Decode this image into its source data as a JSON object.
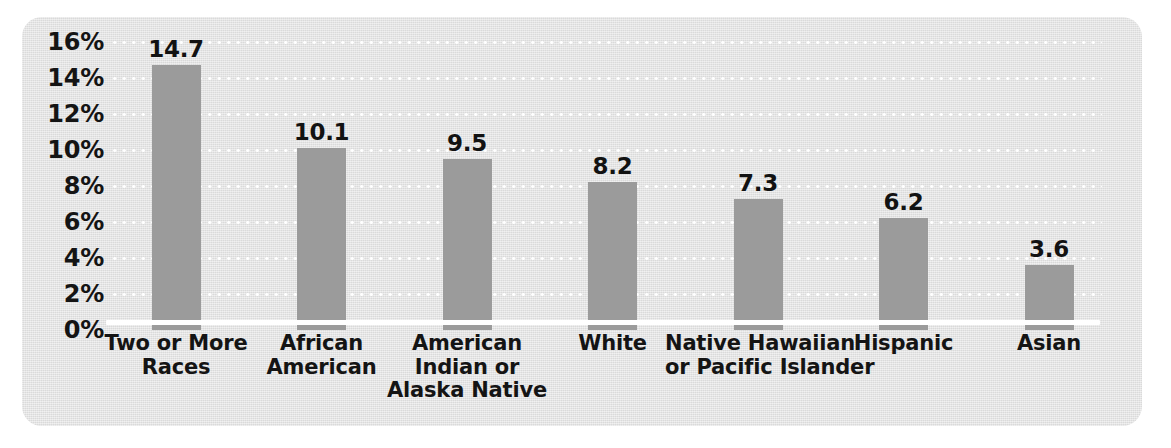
{
  "chart_data": {
    "type": "bar",
    "title": "",
    "subtitle": "",
    "xlabel": "",
    "ylabel": "",
    "categories": [
      "Two or More Races",
      "African American",
      "American Indian or Alaska Native",
      "White",
      "Native Hawaiian or Pacific Islander",
      "Hispanic",
      "Asian"
    ],
    "category_lines": [
      [
        "Two or More",
        "Races"
      ],
      [
        "African",
        "American"
      ],
      [
        "American",
        "Indian or",
        "Alaska Native"
      ],
      [
        "White"
      ],
      [
        "Native Hawaiian",
        "or Pacific Islander"
      ],
      [
        "Hispanic"
      ],
      [
        "Asian"
      ]
    ],
    "values": [
      14.7,
      10.1,
      9.5,
      8.2,
      7.3,
      6.2,
      3.6
    ],
    "value_labels": [
      "14.7",
      "10.1",
      "9.5",
      "8.2",
      "7.3",
      "6.2",
      "3.6"
    ],
    "ylim": [
      0,
      16
    ],
    "ytick_values": [
      0,
      2,
      4,
      6,
      8,
      10,
      12,
      14,
      16
    ],
    "ytick_labels": [
      "0%",
      "2%",
      "4%",
      "6%",
      "8%",
      "10%",
      "12%",
      "14%",
      "16%"
    ],
    "yunit": "%",
    "grid": "horizontal-dotted",
    "legend": "none",
    "colors": {
      "bar": "#9b9b9b",
      "panel_background": "#e2e2e2",
      "gridline": "#ffffff",
      "axis_line": "#ffffff",
      "text": "#141414",
      "page_background": "#ffffff"
    }
  }
}
